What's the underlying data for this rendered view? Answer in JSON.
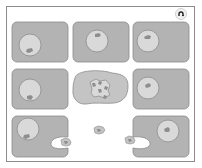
{
  "diagram": {
    "title": "",
    "colors": {
      "cytoplasm": "#b3b3b3",
      "cell_outline": "#8a8a8a",
      "nucleus": "#d9d9d9",
      "nucleus_outline": "#8a8a8a",
      "nucleolus": "#8e8e8e",
      "apoptotic_cell": "#c4c4c4",
      "frame": "#8c8c8c"
    },
    "cells": [
      {
        "id": "cell-r1c1",
        "state": "healthy"
      },
      {
        "id": "cell-r1c2",
        "state": "healthy"
      },
      {
        "id": "cell-r1c3",
        "state": "healthy"
      },
      {
        "id": "cell-r2c1",
        "state": "healthy"
      },
      {
        "id": "cell-r2c2",
        "state": "apoptotic, fragmented nucleus"
      },
      {
        "id": "cell-r2c3",
        "state": "healthy"
      },
      {
        "id": "cell-r3c1",
        "state": "phagocytosing"
      },
      {
        "id": "cell-r3c2",
        "state": "free apoptotic body"
      },
      {
        "id": "cell-r3c3",
        "state": "phagocytosing"
      }
    ],
    "controls": {
      "replay_icon": "replay-icon"
    }
  }
}
